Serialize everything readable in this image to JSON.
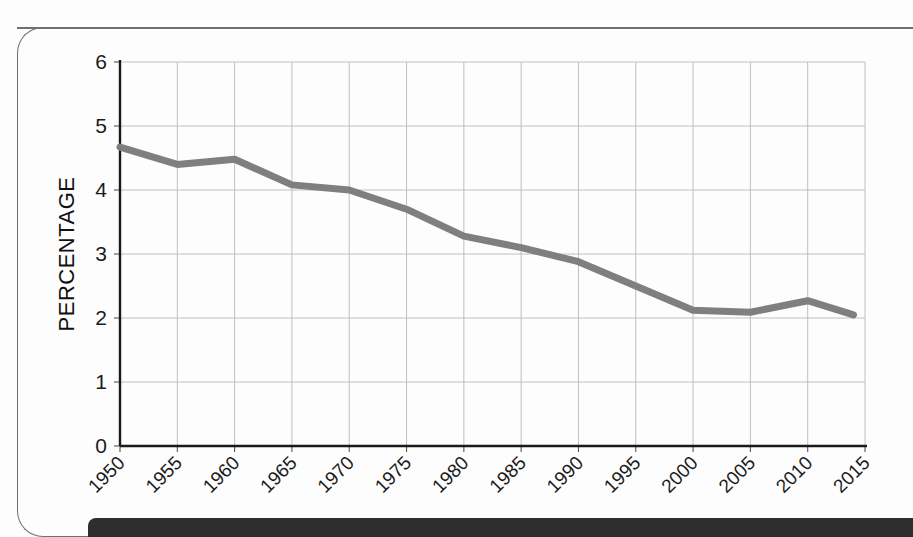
{
  "chart_data": {
    "type": "line",
    "title": "",
    "xlabel": "",
    "ylabel": "PERCENTAGE",
    "ylim": [
      0,
      6
    ],
    "xlim": [
      1950,
      2015
    ],
    "grid": true,
    "legend": "none",
    "y_ticks": [
      "0",
      "1",
      "2",
      "3",
      "4",
      "5",
      "6"
    ],
    "categories": [
      "1950",
      "1955",
      "1960",
      "1965",
      "1970",
      "1975",
      "1980",
      "1985",
      "1990",
      "1995",
      "2000",
      "2005",
      "2010",
      "2015"
    ],
    "x": [
      1950,
      1955,
      1960,
      1965,
      1970,
      1975,
      1980,
      1985,
      1990,
      1995,
      2000,
      2005,
      2010,
      2014
    ],
    "values": [
      4.67,
      4.4,
      4.48,
      4.08,
      4.0,
      3.7,
      3.28,
      3.1,
      2.88,
      2.5,
      2.12,
      2.09,
      2.27,
      2.05
    ],
    "series": [
      {
        "name": "Percentage",
        "color": "#7f7f7f",
        "values": [
          4.67,
          4.4,
          4.48,
          4.08,
          4.0,
          3.7,
          3.28,
          3.1,
          2.88,
          2.5,
          2.12,
          2.09,
          2.27,
          2.05
        ]
      }
    ]
  },
  "colors": {
    "line": "#7f7f7f",
    "grid": "#b9b9b9",
    "axis": "#1a1a1a",
    "bottom_bar": "#2e2e2e",
    "page_border": "#6f6f6f",
    "background": "#fdfdfd"
  }
}
